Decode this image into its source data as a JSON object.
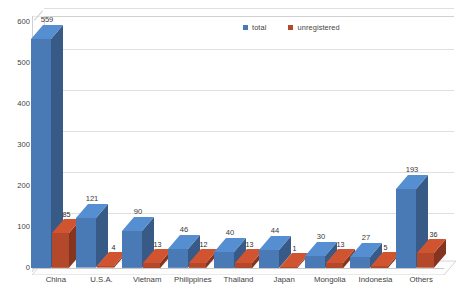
{
  "chart_data": {
    "type": "bar",
    "title": "",
    "subtitle": "",
    "xlabel": "",
    "ylabel": "",
    "ylim": [
      0,
      600
    ],
    "ytick_step": 100,
    "yticks": [
      "0",
      "100",
      "200",
      "300",
      "400",
      "500",
      "600"
    ],
    "grid": true,
    "three_d": true,
    "legend_position": "top-center-right",
    "categories": [
      "China",
      "U.S.A.",
      "Vietnam",
      "Philippines",
      "Thailand",
      "Japan",
      "Mongolia",
      "Indonesia",
      "Others"
    ],
    "series": [
      {
        "name": "total",
        "color": "#4A7AB5",
        "values": [
          559,
          121,
          90,
          46,
          40,
          44,
          30,
          27,
          193
        ],
        "labels": [
          "559",
          "121",
          "90",
          "46",
          "40",
          "44",
          "30",
          "27",
          "193"
        ]
      },
      {
        "name": "unregistered",
        "color": "#B4482A",
        "values": [
          85,
          4,
          13,
          12,
          13,
          1,
          13,
          5,
          36
        ],
        "labels": [
          "85",
          "4",
          "13",
          "12",
          "13",
          "1",
          "13",
          "5",
          "36"
        ]
      }
    ]
  },
  "legend": {
    "entries": [
      {
        "label": "total",
        "color": "#4A7AB5",
        "swatch": "legend-swatch-total"
      },
      {
        "label": "unregistered",
        "color": "#B4482A",
        "swatch": "legend-swatch-unregistered"
      }
    ]
  },
  "colors": {
    "series_total": "#4A7AB5",
    "series_unregistered": "#B4482A",
    "gridline": "#dfdfdf",
    "axis": "#c9c9c9",
    "text": "#3f3f3f",
    "background": "#ffffff"
  }
}
